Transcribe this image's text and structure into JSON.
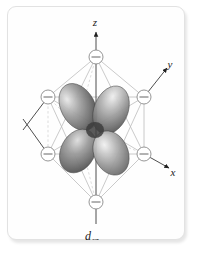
{
  "figure": {
    "name": "d-orbital in octahedral crystal field",
    "caption": "d",
    "caption_subscript": "xz",
    "background_color": "#ffffff",
    "frame_color": "#e2e2e2"
  },
  "axes": [
    {
      "id": "z",
      "label": "z",
      "direction": "up",
      "label_x": 88,
      "label_y": 17
    },
    {
      "id": "y",
      "label": "y",
      "direction": "upper-right",
      "label_x": 160,
      "label_y": 70
    },
    {
      "id": "x",
      "label": "x",
      "direction": "lower-right",
      "label_x": 162,
      "label_y": 168
    }
  ],
  "ligands": [
    {
      "id": "ligand-top",
      "symbol": "−",
      "cx": 89,
      "cy": 51,
      "r": 7
    },
    {
      "id": "ligand-bottom",
      "symbol": "−",
      "cx": 89,
      "cy": 196,
      "r": 7
    },
    {
      "id": "ligand-upper-left",
      "symbol": "−",
      "cx": 41,
      "cy": 91,
      "r": 7
    },
    {
      "id": "ligand-upper-right",
      "symbol": "−",
      "cx": 137,
      "cy": 91,
      "r": 7
    },
    {
      "id": "ligand-lower-left",
      "symbol": "−",
      "cx": 41,
      "cy": 148,
      "r": 7
    },
    {
      "id": "ligand-lower-right",
      "symbol": "−",
      "cx": 137,
      "cy": 148,
      "r": 7
    }
  ],
  "lobes": [
    {
      "id": "lobe-upper-left",
      "orientation": "upper-left"
    },
    {
      "id": "lobe-upper-right",
      "orientation": "upper-right"
    },
    {
      "id": "lobe-lower-left",
      "orientation": "lower-left"
    },
    {
      "id": "lobe-lower-right",
      "orientation": "lower-right"
    }
  ],
  "colors": {
    "axis_line": "#3a3a3a",
    "octahedron_edge": "#b9b9b9",
    "octahedron_hidden_edge": "#cccccc",
    "ligand_stroke": "#8a8a8a",
    "lobe_dark": "#4d4d4d",
    "lobe_mid": "#9a9a9a",
    "lobe_light": "#e6e6e6"
  }
}
